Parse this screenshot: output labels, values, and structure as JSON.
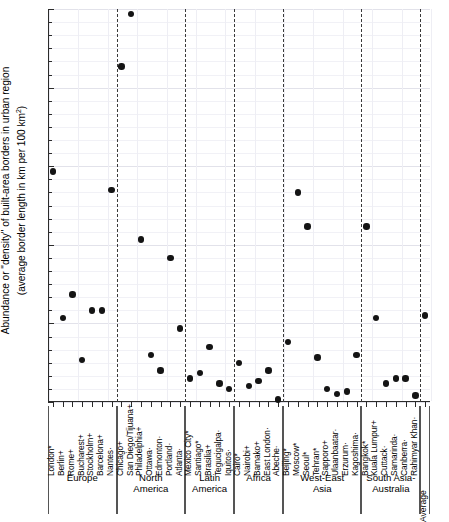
{
  "chart_data": {
    "type": "scatter",
    "title": "",
    "xlabel": "",
    "ylabel": "Abundance or \"density\" of built-area borders in urban region (average border length in km per 100 km²)",
    "ylabel_line1": "Abundance or \"density\" of built-area borders in urban region",
    "ylabel_line2": "(average border length in km per 100 km²)",
    "ylim": [
      0,
      15
    ],
    "yticks": [
      0,
      3,
      6,
      9,
      12,
      15
    ],
    "ytick_labels": [
      "0",
      "3",
      "6",
      "9",
      "12",
      "15"
    ],
    "ytick_minor_step": 0.5,
    "grid": true,
    "legend": "none",
    "marker": "filled-circle",
    "marker_color": "#141414",
    "categories": [
      "London*",
      "Berlin+",
      "Rome+",
      "Bucharest+",
      "Stockholm+",
      "Barcelona+",
      "Nantes·",
      "Chicago+",
      "San Diego/Tijuana+",
      "Philadelphia+",
      "Ottawa·",
      "Edmonton·",
      "Portland·",
      "Atlanta·",
      "Mexico City*",
      "Santiago*",
      "Brasilia+",
      "Tegucigalpa·",
      "Iquitos·",
      "Cairo*",
      "Nairobi+",
      "Bamako+",
      "East London·",
      "Abeche·",
      "Beijing*",
      "Moscow*",
      "Seoul*",
      "Tehran*",
      "Sapporo+",
      "Ulaanbaatar·",
      "Erzurum·",
      "Kagoshima·",
      "Bangkok*",
      "Kuala Lumpur+",
      "Cuttack·",
      "Samarinda·",
      "Canberra·",
      "Rahimyar Khan·",
      "Average"
    ],
    "values": [
      8.8,
      3.2,
      4.1,
      1.6,
      3.5,
      3.5,
      8.1,
      12.8,
      14.8,
      6.2,
      1.8,
      1.2,
      5.5,
      2.8,
      0.9,
      1.1,
      2.1,
      0.7,
      0.5,
      1.5,
      0.6,
      0.8,
      1.2,
      0.1,
      2.3,
      8.0,
      6.7,
      1.7,
      0.5,
      0.3,
      0.4,
      1.8,
      6.7,
      3.2,
      0.7,
      0.9,
      0.9,
      0.25,
      3.3
    ],
    "regions": [
      {
        "name": "Europe",
        "name_line1": "Europe",
        "name_line2": "",
        "start": 0,
        "count": 7
      },
      {
        "name": "North America",
        "name_line1": "North",
        "name_line2": "America",
        "start": 7,
        "count": 7
      },
      {
        "name": "Latin America",
        "name_line1": "Latin",
        "name_line2": "America",
        "start": 14,
        "count": 5
      },
      {
        "name": "Africa",
        "name_line1": "Africa",
        "name_line2": "",
        "start": 19,
        "count": 5
      },
      {
        "name": "West-East Asia",
        "name_line1": "West-East",
        "name_line2": "Asia",
        "start": 24,
        "count": 8
      },
      {
        "name": "South Asia-Australia",
        "name_line1": "South Asia-",
        "name_line2": "Australia",
        "start": 32,
        "count": 6
      },
      {
        "name": "Average",
        "name_line1": "",
        "name_line2": "",
        "start": 38,
        "count": 1
      }
    ]
  }
}
